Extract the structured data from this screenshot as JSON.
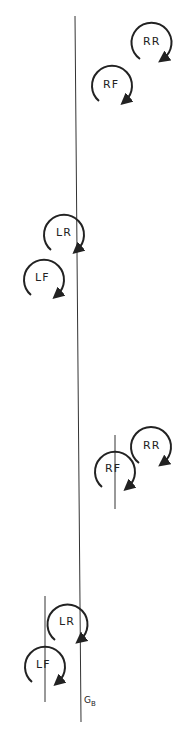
{
  "diagram": {
    "reference_line_label": "G",
    "reference_line_sub": "B",
    "groups": [
      {
        "name": "upper",
        "wheels": [
          {
            "label": "RR",
            "cx": 151,
            "cy": 44
          },
          {
            "label": "RF",
            "cx": 112,
            "cy": 86
          },
          {
            "label": "LR",
            "cx": 63,
            "cy": 234
          },
          {
            "label": "LF",
            "cx": 42,
            "cy": 277
          }
        ]
      },
      {
        "name": "lower",
        "wheels": [
          {
            "label": "RR",
            "cx": 151,
            "cy": 454
          },
          {
            "label": "RF",
            "cx": 115,
            "cy": 467
          },
          {
            "label": "LR",
            "cx": 66,
            "cy": 626
          },
          {
            "label": "LF",
            "cx": 38,
            "cy": 664
          }
        ]
      }
    ],
    "colors": {
      "stroke": "#222222",
      "background": "#ffffff"
    }
  }
}
